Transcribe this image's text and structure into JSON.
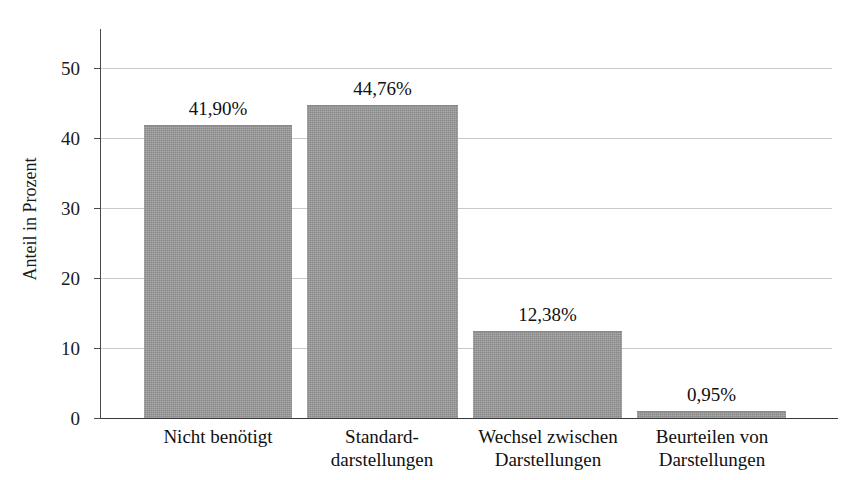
{
  "chart_data": {
    "type": "bar",
    "title": "",
    "subtitle": "",
    "xlabel": "",
    "ylabel": "Anteil in Prozent",
    "ylim": [
      0,
      55
    ],
    "yticks": [
      0,
      10,
      20,
      30,
      40,
      50
    ],
    "ytick_labels": [
      "0",
      "10",
      "20",
      "30",
      "40",
      "50"
    ],
    "grid": true,
    "legend": false,
    "legend_position": "none",
    "bar_color": "#969696",
    "categories": [
      "Nicht benötigt",
      "Standard-darstellungen",
      "Wechsel zwischen Darstellungen",
      "Beurteilen von Darstellungen"
    ],
    "category_lines": [
      [
        "Nicht benötigt"
      ],
      [
        "Standard-",
        "darstellungen"
      ],
      [
        "Wechsel zwischen",
        "Darstellungen"
      ],
      [
        "Beurteilen von",
        "Darstellungen"
      ]
    ],
    "values": [
      41.9,
      44.76,
      12.38,
      0.95
    ],
    "value_labels": [
      "41,90%",
      "44,76%",
      "12,38%",
      "0,95%"
    ]
  },
  "axis": {
    "y_title": "Anteil in Prozent",
    "ticks": [
      "50",
      "40",
      "30",
      "20",
      "10",
      "0"
    ]
  }
}
